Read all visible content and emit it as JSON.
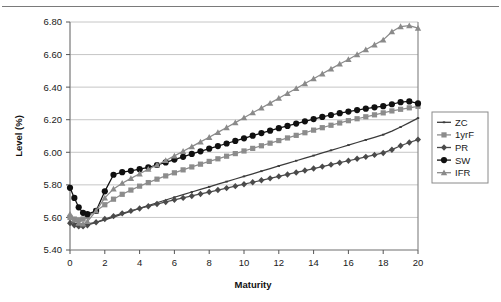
{
  "chart_data": {
    "type": "line",
    "title": "",
    "xlabel": "Maturity",
    "ylabel": "Level (%)",
    "xlim": [
      0,
      20
    ],
    "ylim": [
      5.4,
      6.8
    ],
    "xticks": [
      0,
      2,
      4,
      6,
      8,
      10,
      12,
      14,
      16,
      18,
      20
    ],
    "xtick_labels": [
      "0",
      "2",
      "4",
      "6",
      "8",
      "10",
      "12",
      "14",
      "16",
      "18",
      "20"
    ],
    "yticks": [
      5.4,
      5.6,
      5.8,
      6.0,
      6.2,
      6.4,
      6.6,
      6.8
    ],
    "ytick_labels": [
      "5.40",
      "5.60",
      "5.80",
      "6.00",
      "6.20",
      "6.40",
      "6.60",
      "6.80"
    ],
    "grid": "horizontal",
    "legend_position": "right",
    "x": [
      0,
      0.25,
      0.5,
      0.75,
      1,
      1.5,
      2,
      2.5,
      3,
      3.5,
      4,
      4.5,
      5,
      5.5,
      6,
      6.5,
      7,
      7.5,
      8,
      8.5,
      9,
      9.5,
      10,
      10.5,
      11,
      11.5,
      12,
      12.5,
      13,
      13.5,
      14,
      14.5,
      15,
      15.5,
      16,
      16.5,
      17,
      17.5,
      18,
      18.5,
      19,
      19.5,
      20
    ],
    "series": [
      {
        "name": "ZC",
        "marker": "dash",
        "color": "#3b3b3b",
        "values": [
          5.575,
          5.565,
          5.56,
          5.558,
          5.56,
          5.57,
          5.585,
          5.602,
          5.62,
          5.638,
          5.656,
          5.673,
          5.69,
          5.707,
          5.724,
          5.74,
          5.756,
          5.772,
          5.788,
          5.804,
          5.82,
          5.836,
          5.852,
          5.868,
          5.884,
          5.9,
          5.916,
          5.932,
          5.948,
          5.964,
          5.98,
          5.996,
          6.012,
          6.028,
          6.044,
          6.06,
          6.076,
          6.092,
          6.108,
          6.13,
          6.155,
          6.182,
          6.21
        ]
      },
      {
        "name": "1yrF",
        "marker": "square",
        "color": "#8c8c8c",
        "values": [
          5.6,
          5.59,
          5.585,
          5.59,
          5.605,
          5.64,
          5.678,
          5.712,
          5.742,
          5.768,
          5.792,
          5.814,
          5.835,
          5.855,
          5.874,
          5.892,
          5.91,
          5.927,
          5.944,
          5.96,
          5.976,
          5.992,
          6.008,
          6.024,
          6.04,
          6.056,
          6.072,
          6.088,
          6.104,
          6.12,
          6.136,
          6.151,
          6.166,
          6.18,
          6.194,
          6.206,
          6.218,
          6.23,
          6.242,
          6.254,
          6.264,
          6.273,
          6.282
        ]
      },
      {
        "name": "PR",
        "marker": "diamond",
        "color": "#4a4a4a",
        "values": [
          5.565,
          5.552,
          5.545,
          5.545,
          5.552,
          5.57,
          5.59,
          5.608,
          5.625,
          5.64,
          5.655,
          5.669,
          5.682,
          5.695,
          5.708,
          5.72,
          5.732,
          5.744,
          5.756,
          5.768,
          5.78,
          5.792,
          5.804,
          5.816,
          5.828,
          5.84,
          5.852,
          5.864,
          5.876,
          5.888,
          5.9,
          5.912,
          5.924,
          5.936,
          5.948,
          5.96,
          5.972,
          5.984,
          5.996,
          6.016,
          6.04,
          6.06,
          6.078
        ]
      },
      {
        "name": "SW",
        "marker": "circle",
        "color": "#101010",
        "values": [
          5.782,
          5.72,
          5.662,
          5.628,
          5.62,
          5.64,
          5.76,
          5.862,
          5.878,
          5.886,
          5.896,
          5.908,
          5.922,
          5.938,
          5.955,
          5.972,
          5.99,
          6.006,
          6.022,
          6.038,
          6.054,
          6.07,
          6.086,
          6.102,
          6.118,
          6.133,
          6.148,
          6.162,
          6.176,
          6.19,
          6.204,
          6.217,
          6.229,
          6.24,
          6.25,
          6.259,
          6.268,
          6.276,
          6.283,
          6.295,
          6.308,
          6.312,
          6.3
        ]
      },
      {
        "name": "IFR",
        "marker": "triangle",
        "color": "#8a8a8a",
        "values": [
          5.62,
          5.585,
          5.565,
          5.56,
          5.575,
          5.64,
          5.72,
          5.775,
          5.81,
          5.84,
          5.868,
          5.896,
          5.922,
          5.95,
          5.978,
          6.006,
          6.035,
          6.064,
          6.092,
          6.122,
          6.152,
          6.182,
          6.212,
          6.243,
          6.272,
          6.302,
          6.332,
          6.362,
          6.392,
          6.422,
          6.452,
          6.482,
          6.512,
          6.542,
          6.57,
          6.6,
          6.63,
          6.66,
          6.69,
          6.74,
          6.772,
          6.778,
          6.762
        ]
      }
    ],
    "legend_entries": [
      "ZC",
      "1yrF",
      "PR",
      "SW",
      "IFR"
    ]
  }
}
